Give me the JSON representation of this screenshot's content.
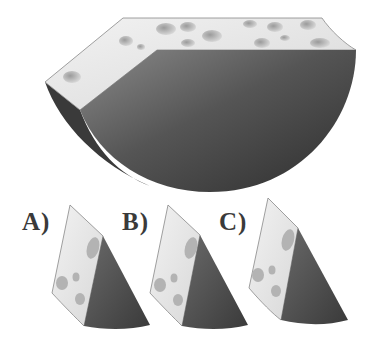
{
  "puzzle": {
    "main_figure": "cheese-wedge-with-holes",
    "options": [
      {
        "label": "A)"
      },
      {
        "label": "B)"
      },
      {
        "label": "C)"
      }
    ]
  },
  "colors": {
    "cheese_face": "#e6e6e6",
    "cut_face_dark": "#4a4a4a",
    "cut_face_mid": "#6e6e6e",
    "hole": "#b9b9b9",
    "label_text": "#3a3a3a"
  }
}
